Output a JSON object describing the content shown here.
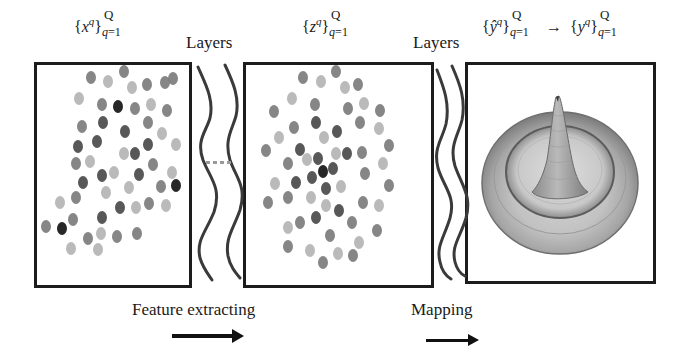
{
  "figure": {
    "header": {
      "input_set": {
        "var": "x",
        "sup": "q",
        "upper": "Q",
        "lower_var": "q",
        "lower_eq": "=1"
      },
      "layers_label_1": "Layers",
      "latent_set": {
        "var": "z",
        "sup": "q",
        "upper": "Q",
        "lower_var": "q",
        "lower_eq": "=1"
      },
      "layers_label_2": "Layers",
      "output_set_pred": {
        "var": "ŷ",
        "sup": "q",
        "upper": "Q",
        "lower_var": "q",
        "lower_eq": "=1"
      },
      "mapping_arrow_symbol": "→",
      "output_set_true": {
        "var": "y",
        "sup": "q",
        "upper": "Q",
        "lower_var": "q",
        "lower_eq": "=1"
      }
    },
    "panels": [
      {
        "name": "input-scatter-panel",
        "description": "scattered input points"
      },
      {
        "name": "latent-scatter-panel",
        "description": "clustered latent features"
      },
      {
        "name": "output-surface-panel",
        "description": "3D Mexican-hat surface"
      }
    ],
    "ellipsis": "...",
    "footer": {
      "feature_label": "Feature extracting",
      "mapping_label": "Mapping"
    },
    "colors": {
      "border": "#1c1c1c",
      "black_dot": "#151515",
      "dark_dot": "#4a4a4a",
      "mid_dot": "#7c7c7c",
      "light_dot": "#b4b4b4",
      "surface": "#a8a8a8"
    }
  }
}
